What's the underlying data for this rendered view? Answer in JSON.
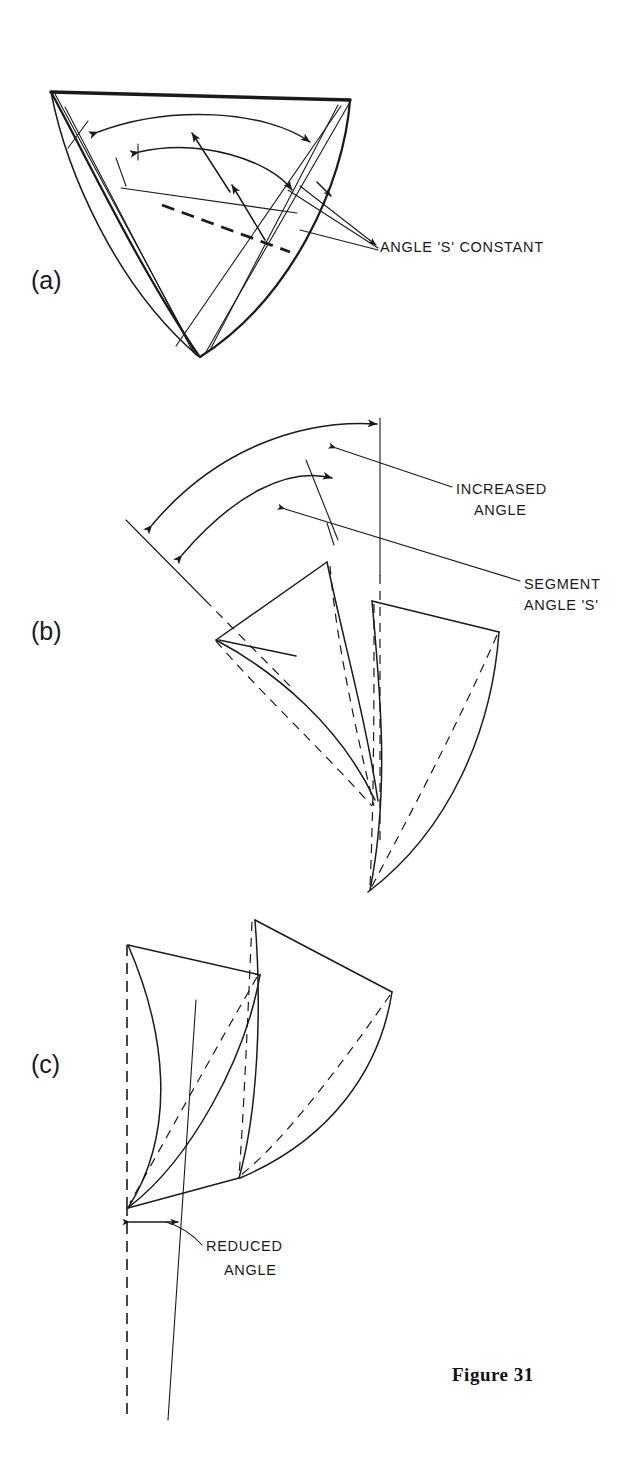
{
  "figure": {
    "caption": "Figure 31",
    "caption_x": 452,
    "caption_y": 1381
  },
  "panels": [
    {
      "id": "a",
      "letter": "(a)",
      "letter_x": 31,
      "letter_y": 289,
      "labels": [
        {
          "name": "angle-s-constant",
          "text": "ANGLE 'S' CONSTANT",
          "x": 380,
          "y": 252
        }
      ]
    },
    {
      "id": "b",
      "letter": "(b)",
      "letter_x": 31,
      "letter_y": 640,
      "labels": [
        {
          "name": "increased-angle-line1",
          "text": "INCREASED",
          "x": 456,
          "y": 494
        },
        {
          "name": "increased-angle-line2",
          "text": "ANGLE",
          "x": 474,
          "y": 515
        },
        {
          "name": "segment-angle-line1",
          "text": "SEGMENT",
          "x": 524,
          "y": 589
        },
        {
          "name": "segment-angle-line2",
          "text": "ANGLE 'S'",
          "x": 524,
          "y": 610
        }
      ]
    },
    {
      "id": "c",
      "letter": "(c)",
      "letter_x": 31,
      "letter_y": 1073,
      "labels": [
        {
          "name": "reduced-angle-line1",
          "text": "REDUCED",
          "x": 206,
          "y": 1251
        },
        {
          "name": "reduced-angle-line2",
          "text": "ANGLE",
          "x": 224,
          "y": 1275
        }
      ]
    }
  ],
  "colors": {
    "ink": "#1a1a1a",
    "background": "#ffffff"
  },
  "diagram_data": {
    "type": "line-drawing",
    "subject": "Impeller blade segment angle variation",
    "description": "Three isometric line drawings of curved impeller blade segments showing how segment angle 'S' relates to the included angle.",
    "panel_a_meaning": "Two overlapping curved segments with concentric double-headed arc arrows; the angle 'S' stays constant.",
    "panel_b_meaning": "Two curved blade segments spread apart; outer arc shows the increased angle while the inner arc shows segment angle 'S'.",
    "panel_c_meaning": "Two curved blade segments closed together against a vertical dashed axis, producing a reduced angle."
  }
}
